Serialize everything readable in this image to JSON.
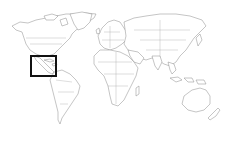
{
  "map": {
    "type": "world-locator-map",
    "projection": "equirectangular-style",
    "background_color": "#ffffff",
    "land_fill": "#ffffff",
    "outline_color": "#8a8a8a",
    "highlight": {
      "region": "Central America and the Caribbean",
      "shape": "rectangle",
      "stroke_color": "#111111",
      "stroke_width": 2,
      "bbox_px": {
        "x": 31,
        "y": 56,
        "width": 25,
        "height": 20
      }
    },
    "regions": [
      "North America",
      "Central America",
      "South America",
      "Europe",
      "Africa",
      "Asia",
      "Oceania"
    ]
  }
}
